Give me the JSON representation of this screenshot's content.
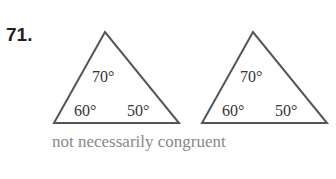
{
  "problem_number": "71.",
  "triangles": [
    {
      "angles": {
        "top": "70°",
        "left": "60°",
        "right": "50°"
      }
    },
    {
      "angles": {
        "top": "70°",
        "left": "60°",
        "right": "50°"
      }
    }
  ],
  "caption": "not necessarily congruent",
  "colors": {
    "stroke": "#555555",
    "caption": "#888888"
  }
}
